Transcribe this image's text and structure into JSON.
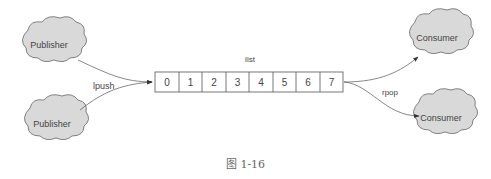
{
  "diagram": {
    "publishers": [
      {
        "label": "Publisher"
      },
      {
        "label": "Publisher"
      }
    ],
    "consumers": [
      {
        "label": "Consumer"
      },
      {
        "label": "Consumer"
      }
    ],
    "list": {
      "title": "list",
      "cells": [
        "0",
        "1",
        "2",
        "3",
        "4",
        "5",
        "6",
        "7"
      ]
    },
    "edges": {
      "push_label": "lpush",
      "pop_label": "rpop"
    },
    "colors": {
      "cloud_fill": "#d9d9d9",
      "stroke": "#555555"
    }
  },
  "caption": "图 1-16"
}
